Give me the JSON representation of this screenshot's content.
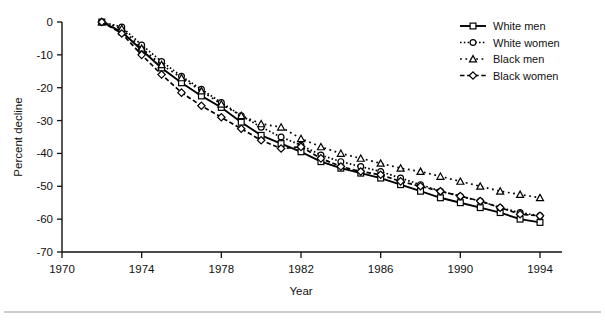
{
  "figure": {
    "background": "#ffffff",
    "axis_color": "#111111",
    "rule_color": "#9a9a9a"
  },
  "chart_data": {
    "type": "line",
    "title": "",
    "xlabel": "Year",
    "ylabel": "Percent decline",
    "xlim": [
      1970,
      1994
    ],
    "ylim": [
      -70,
      0
    ],
    "xticks": [
      1970,
      1974,
      1978,
      1982,
      1986,
      1990,
      1994
    ],
    "xticklabels": [
      "1970",
      "1974",
      "1978",
      "1982",
      "1986",
      "1990",
      "1994"
    ],
    "yticks": [
      0,
      -10,
      -20,
      -30,
      -40,
      -50,
      -60,
      -70
    ],
    "yticklabels": [
      "0",
      "-10",
      "-20",
      "-30",
      "-40",
      "-50",
      "-60",
      "-70"
    ],
    "grid": false,
    "legend_position": "upper right",
    "x": [
      1972,
      1973,
      1974,
      1975,
      1976,
      1977,
      1978,
      1979,
      1980,
      1981,
      1982,
      1983,
      1984,
      1985,
      1986,
      1987,
      1988,
      1989,
      1990,
      1991,
      1992,
      1993,
      1994
    ],
    "series": [
      {
        "name": "White men",
        "marker": "square",
        "linestyle": "solid",
        "values": [
          0,
          -3.0,
          -8.5,
          -14.0,
          -18.5,
          -22.5,
          -26.0,
          -30.5,
          -34.5,
          -37.0,
          -39.5,
          -42.5,
          -44.5,
          -46.0,
          -47.5,
          -49.5,
          -51.5,
          -53.5,
          -55.0,
          -56.5,
          -58.0,
          -60.0,
          -61.0
        ]
      },
      {
        "name": "White women",
        "marker": "circle",
        "linestyle": "dotted",
        "values": [
          0,
          -1.5,
          -7.0,
          -12.0,
          -16.5,
          -20.5,
          -24.5,
          -28.5,
          -32.0,
          -35.0,
          -37.5,
          -40.5,
          -42.5,
          -44.0,
          -45.5,
          -47.5,
          -49.5,
          -51.5,
          -53.0,
          -54.5,
          -56.5,
          -58.0,
          -59.0
        ]
      },
      {
        "name": "Black men",
        "marker": "triangle",
        "linestyle": "dotted-wide",
        "values": [
          0,
          -2.0,
          -8.0,
          -13.0,
          -17.0,
          -21.0,
          -25.0,
          -28.5,
          -31.0,
          -32.0,
          -35.5,
          -38.0,
          -40.0,
          -41.5,
          -43.0,
          -44.5,
          -45.5,
          -47.0,
          -48.5,
          -50.0,
          -51.5,
          -52.5,
          -53.5
        ]
      },
      {
        "name": "Black women",
        "marker": "diamond",
        "linestyle": "dashed",
        "values": [
          0,
          -3.5,
          -10.0,
          -16.0,
          -21.5,
          -25.5,
          -29.0,
          -32.5,
          -36.0,
          -38.5,
          -38.0,
          -41.5,
          -44.0,
          -45.5,
          -46.5,
          -48.5,
          -50.0,
          -51.5,
          -53.0,
          -54.5,
          -56.5,
          -58.5,
          -59.0
        ]
      }
    ]
  },
  "legend": {
    "items": [
      {
        "label": "White men"
      },
      {
        "label": "White women"
      },
      {
        "label": "Black men"
      },
      {
        "label": "Black women"
      }
    ]
  }
}
